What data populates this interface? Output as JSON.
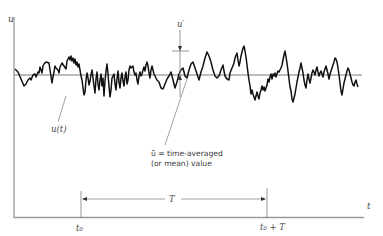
{
  "figure": {
    "type": "turbulent-velocity-time-trace",
    "axes": {
      "y_label": "u",
      "x_label": "t"
    },
    "annotations": {
      "fluctuation_label": "u′",
      "signal_label": "u(t)",
      "mean_label_line1": "ū = time-averaged",
      "mean_label_line2": "(or mean) value",
      "interval_label": "T",
      "start_tick_label": "t₀",
      "end_tick_label": "t₀ + T"
    },
    "colors": {
      "signal": "#111111",
      "axes": "#9a9a9a",
      "mean_line": "#7a7a7a",
      "annotation": "#8a8a8a",
      "background": "#ffffff"
    }
  }
}
